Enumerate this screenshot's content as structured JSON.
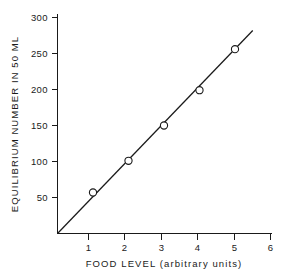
{
  "chart_data": {
    "type": "scatter",
    "title": "",
    "subtitle": "",
    "xlabel": "FOOD LEVEL  (arbitrary units)",
    "ylabel": "EQUILIBRIUM NUMBER IN 50 ML",
    "xlim": [
      0,
      6
    ],
    "ylim": [
      0,
      300
    ],
    "xticks": [
      1,
      2,
      3,
      4,
      5,
      6
    ],
    "xtick_labels": [
      "1",
      "2",
      "3",
      "4",
      "5",
      "6"
    ],
    "yticks": [
      50,
      100,
      150,
      200,
      250,
      300
    ],
    "ytick_labels": [
      "50",
      "100",
      "150",
      "200",
      "250",
      "300"
    ],
    "grid": false,
    "legend": false,
    "legend_position": "none",
    "marker_style": "open-circle",
    "line_color": "#1a1a1a",
    "marker_edge_color": "#1a1a1a",
    "marker_face_color": "#ffffff",
    "background_color": "#ffffff",
    "x": [
      1,
      2,
      3,
      4,
      5
    ],
    "values": [
      57,
      101,
      150,
      199,
      256
    ],
    "series": [
      {
        "name": "equilibrium number",
        "x": [
          1,
          2,
          3,
          4,
          5
        ],
        "values": [
          57,
          101,
          150,
          199,
          256
        ]
      }
    ],
    "fit_line": {
      "description": "straight line through origin",
      "x_start": 0,
      "y_start": 0,
      "x_end": 5.5,
      "y_end": 282
    },
    "annotations": []
  }
}
